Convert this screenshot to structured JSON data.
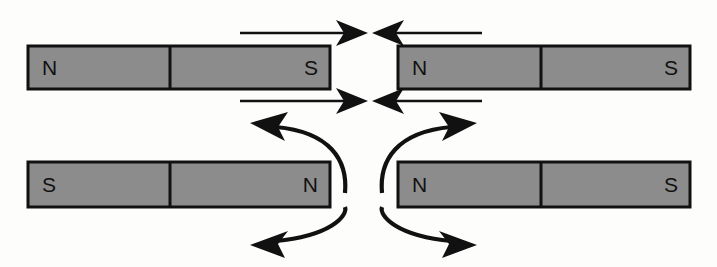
{
  "figure": {
    "canvas": {
      "width": 717,
      "height": 267,
      "background": "#fdfdfc"
    },
    "colors": {
      "magnet_fill": "#8c8c8c",
      "magnet_stroke": "#111111",
      "arrow": "#111111",
      "background": "#fdfdfc"
    }
  },
  "scenarios": [
    {
      "id": "attraction",
      "name": "unlike-poles-attract",
      "row": "top",
      "magnets": [
        {
          "id": "top-left-magnet",
          "x": 28,
          "y": 46,
          "width": 302,
          "height": 43,
          "divider_x": 170,
          "left_pole": "N",
          "right_pole": "S"
        },
        {
          "id": "top-right-magnet",
          "x": 398,
          "y": 46,
          "width": 292,
          "height": 43,
          "divider_x": 541,
          "left_pole": "N",
          "right_pole": "S"
        }
      ],
      "force_arrows": [
        {
          "id": "top-upper-left-force",
          "direction": "right",
          "x1": 240,
          "x2": 366,
          "y": 33
        },
        {
          "id": "top-upper-right-force",
          "direction": "left",
          "x1": 482,
          "x2": 372,
          "y": 33
        },
        {
          "id": "top-lower-left-force",
          "direction": "right",
          "x1": 240,
          "x2": 366,
          "y": 101
        },
        {
          "id": "top-lower-right-force",
          "direction": "left",
          "x1": 482,
          "x2": 372,
          "y": 101
        }
      ]
    },
    {
      "id": "repulsion",
      "name": "like-poles-repel",
      "row": "bottom",
      "magnets": [
        {
          "id": "bottom-left-magnet",
          "x": 28,
          "y": 162,
          "width": 302,
          "height": 45,
          "divider_x": 170,
          "left_pole": "S",
          "right_pole": "N"
        },
        {
          "id": "bottom-right-magnet",
          "x": 398,
          "y": 162,
          "width": 292,
          "height": 45,
          "divider_x": 541,
          "left_pole": "N",
          "right_pole": "S"
        }
      ],
      "torque_arrows": [
        {
          "id": "bottom-upper-left-torque",
          "direction": "counterclockwise-up-left"
        },
        {
          "id": "bottom-lower-left-torque",
          "direction": "counterclockwise-down-left"
        },
        {
          "id": "bottom-upper-right-torque",
          "direction": "clockwise-up-right"
        },
        {
          "id": "bottom-lower-right-torque",
          "direction": "clockwise-down-right"
        }
      ]
    }
  ],
  "labels": {
    "north": "N",
    "south": "S"
  }
}
